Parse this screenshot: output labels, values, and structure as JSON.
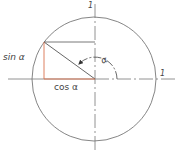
{
  "diagram": {
    "labels": {
      "sin": "sin α",
      "cos": "cos α",
      "alpha": "α",
      "unit_top": "1",
      "unit_right": "1"
    },
    "colors": {
      "line": "#555555",
      "circle": "#666666",
      "highlight": "#d9734f",
      "text": "#444444"
    },
    "geometry": {
      "center": [
        95,
        79
      ],
      "radius": 62,
      "point_on_circle": [
        44,
        42
      ],
      "angle_arc_radius": 22
    }
  }
}
